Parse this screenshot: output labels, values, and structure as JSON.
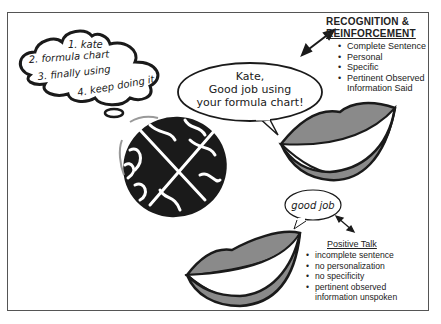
{
  "thought_bubble": {
    "lines": [
      "1. kate",
      "2. formula chart",
      "3. finally using",
      "4. keep doing it"
    ]
  },
  "recognition_speech": {
    "lines": [
      "Kate,",
      "Good job using",
      "your formula chart!"
    ]
  },
  "recognition_panel": {
    "title_line1": "RECOGNITION &",
    "title_line2": "REINFORCEMENT",
    "items": [
      "Complete Sentence",
      "Personal",
      "Specific",
      "Pertinent Observed Information Said"
    ]
  },
  "positive_speech": {
    "text": "good job"
  },
  "positive_panel": {
    "title": "Positive Talk",
    "items": [
      "incomplete sentence",
      "no personalization",
      "no specificity",
      "pertinent observed information unspoken"
    ]
  },
  "colors": {
    "lip_fill": "#8a8a8a",
    "outline": "#1a1a1a",
    "brain": "#111111"
  }
}
